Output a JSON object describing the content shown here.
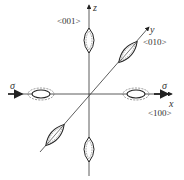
{
  "diagram": {
    "axes": {
      "x": {
        "label": "x",
        "direction": "<100>"
      },
      "y": {
        "label": "y",
        "direction": "<010>"
      },
      "z": {
        "label": "z",
        "direction": "<001>"
      }
    },
    "stress_labels": {
      "left": "σ",
      "right": "σ"
    },
    "colors": {
      "line": "#333333",
      "dash": "#555555"
    }
  }
}
